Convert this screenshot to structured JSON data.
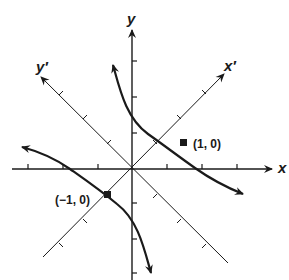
{
  "diagram": {
    "type": "rotated-axes-hyperbola",
    "axes": {
      "x_label": "x",
      "y_label": "y",
      "x_prime_label": "x′",
      "y_prime_label": "y′"
    },
    "points": [
      {
        "label": "(1, 0)",
        "frame": "x'y'"
      },
      {
        "label": "(−1, 0)",
        "frame": "x'y'"
      }
    ],
    "curve": "hyperbola with two branches symmetric about origin, vertices on x' axis",
    "colors": {
      "ink": "#1a1a1a",
      "background": "#ffffff"
    }
  }
}
